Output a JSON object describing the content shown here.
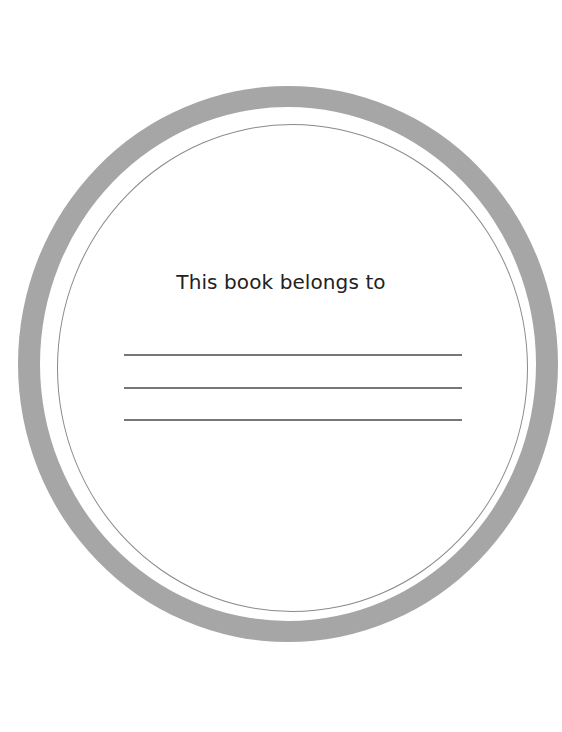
{
  "bookplate": {
    "title": "This book belongs to",
    "name_lines": 3,
    "colors": {
      "ring": "#a6a6a6",
      "inner_circle_stroke": "#8a8a8a",
      "lines": "#777777",
      "text": "#222222",
      "background": "#ffffff"
    }
  }
}
